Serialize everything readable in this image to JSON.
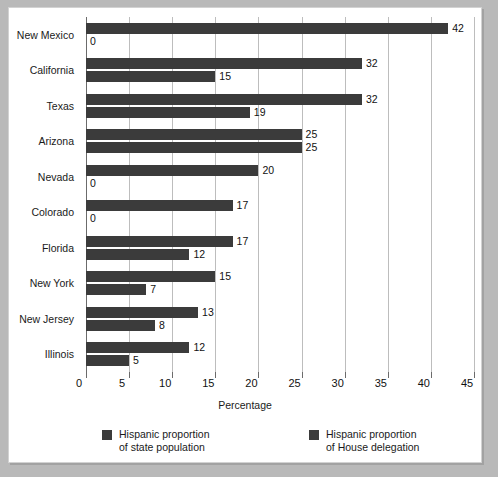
{
  "chart_data": {
    "type": "bar",
    "orientation": "horizontal",
    "title": "",
    "xlabel": "Percentage",
    "ylabel": "",
    "xlim": [
      0,
      45
    ],
    "xticks": [
      0,
      5,
      10,
      15,
      20,
      25,
      30,
      35,
      40,
      45
    ],
    "grid": true,
    "legend_position": "bottom",
    "categories": [
      "New Mexico",
      "California",
      "Texas",
      "Arizona",
      "Nevada",
      "Colorado",
      "Florida",
      "New York",
      "New Jersey",
      "Illinois"
    ],
    "series": [
      {
        "name": "Hispanic proportion\nof state population",
        "color": "#3b3b3b",
        "values": [
          42,
          32,
          32,
          25,
          20,
          17,
          17,
          15,
          13,
          12
        ]
      },
      {
        "name": "Hispanic proportion\nof House delegation",
        "color": "#3b3b3b",
        "values": [
          0,
          15,
          19,
          25,
          0,
          0,
          12,
          7,
          8,
          5
        ]
      }
    ],
    "data_labels": [
      [
        "42",
        "0"
      ],
      [
        "32",
        "15"
      ],
      [
        "32",
        "19"
      ],
      [
        "25",
        "25"
      ],
      [
        "20",
        "0"
      ],
      [
        "17",
        "0"
      ],
      [
        "17",
        "12"
      ],
      [
        "15",
        "7"
      ],
      [
        "13",
        "8"
      ],
      [
        "12",
        "5"
      ]
    ]
  },
  "legend": [
    {
      "label": "Hispanic proportion\nof state population"
    },
    {
      "label": "Hispanic proportion\nof House delegation"
    }
  ],
  "axis": {
    "x_title": "Percentage",
    "tick_labels": [
      "0",
      "5",
      "10",
      "15",
      "20",
      "25",
      "30",
      "35",
      "40",
      "45"
    ]
  },
  "colors": {
    "bar": "#3b3b3b",
    "grid": "#bdbdbd",
    "axis": "#6b6b6b",
    "panel_background": "#ffffff",
    "page_background": "#b9b9b9"
  }
}
